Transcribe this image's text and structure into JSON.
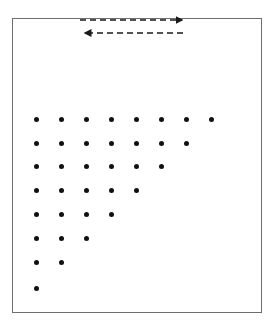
{
  "figure": {
    "title": "Triangular dot array with bidirectional dashed arrows",
    "background_color": "#ffffff",
    "border_color": "#6e6e6e",
    "dot_color": "#111111",
    "arrow_color": "#1a1a1a"
  },
  "frame": {
    "name": "diagram-border",
    "x": 12,
    "y": 18,
    "width": 250,
    "height": 295
  },
  "arrows": [
    {
      "name": "arrow-right",
      "label": "",
      "direction": "right",
      "style": "dashed",
      "x1": 80,
      "x2": 183,
      "y": 20
    },
    {
      "name": "arrow-left",
      "label": "",
      "direction": "left",
      "style": "dashed",
      "x1": 183,
      "x2": 84,
      "y": 33
    }
  ],
  "chart_data": {
    "type": "scatter",
    "title": "",
    "subtitle": "",
    "xlabel": "",
    "ylabel": "",
    "grid": false,
    "legend": null,
    "annotations": [],
    "dot_radius_px": 2.5,
    "origin_x": 36,
    "origin_y": 119,
    "spacing_x": 25,
    "spacing_y": 24,
    "row_counts": [
      8,
      7,
      6,
      5,
      4,
      3,
      2,
      1
    ],
    "total_dots": 36,
    "rows": [
      {
        "row": 1,
        "count": 8,
        "y": 119,
        "x": [
          36,
          61,
          86,
          111,
          136,
          161,
          186,
          211
        ]
      },
      {
        "row": 2,
        "count": 7,
        "y": 143,
        "x": [
          36,
          61,
          86,
          111,
          136,
          161,
          186
        ]
      },
      {
        "row": 3,
        "count": 6,
        "y": 166,
        "x": [
          36,
          61,
          86,
          111,
          136,
          161
        ]
      },
      {
        "row": 4,
        "count": 5,
        "y": 190,
        "x": [
          36,
          61,
          86,
          111,
          136
        ]
      },
      {
        "row": 5,
        "count": 4,
        "y": 214,
        "x": [
          36,
          61,
          86,
          111
        ]
      },
      {
        "row": 6,
        "count": 3,
        "y": 238,
        "x": [
          36,
          61,
          86
        ]
      },
      {
        "row": 7,
        "count": 2,
        "y": 262,
        "x": [
          36,
          61
        ]
      },
      {
        "row": 8,
        "count": 1,
        "y": 288,
        "x": [
          36
        ]
      }
    ]
  }
}
